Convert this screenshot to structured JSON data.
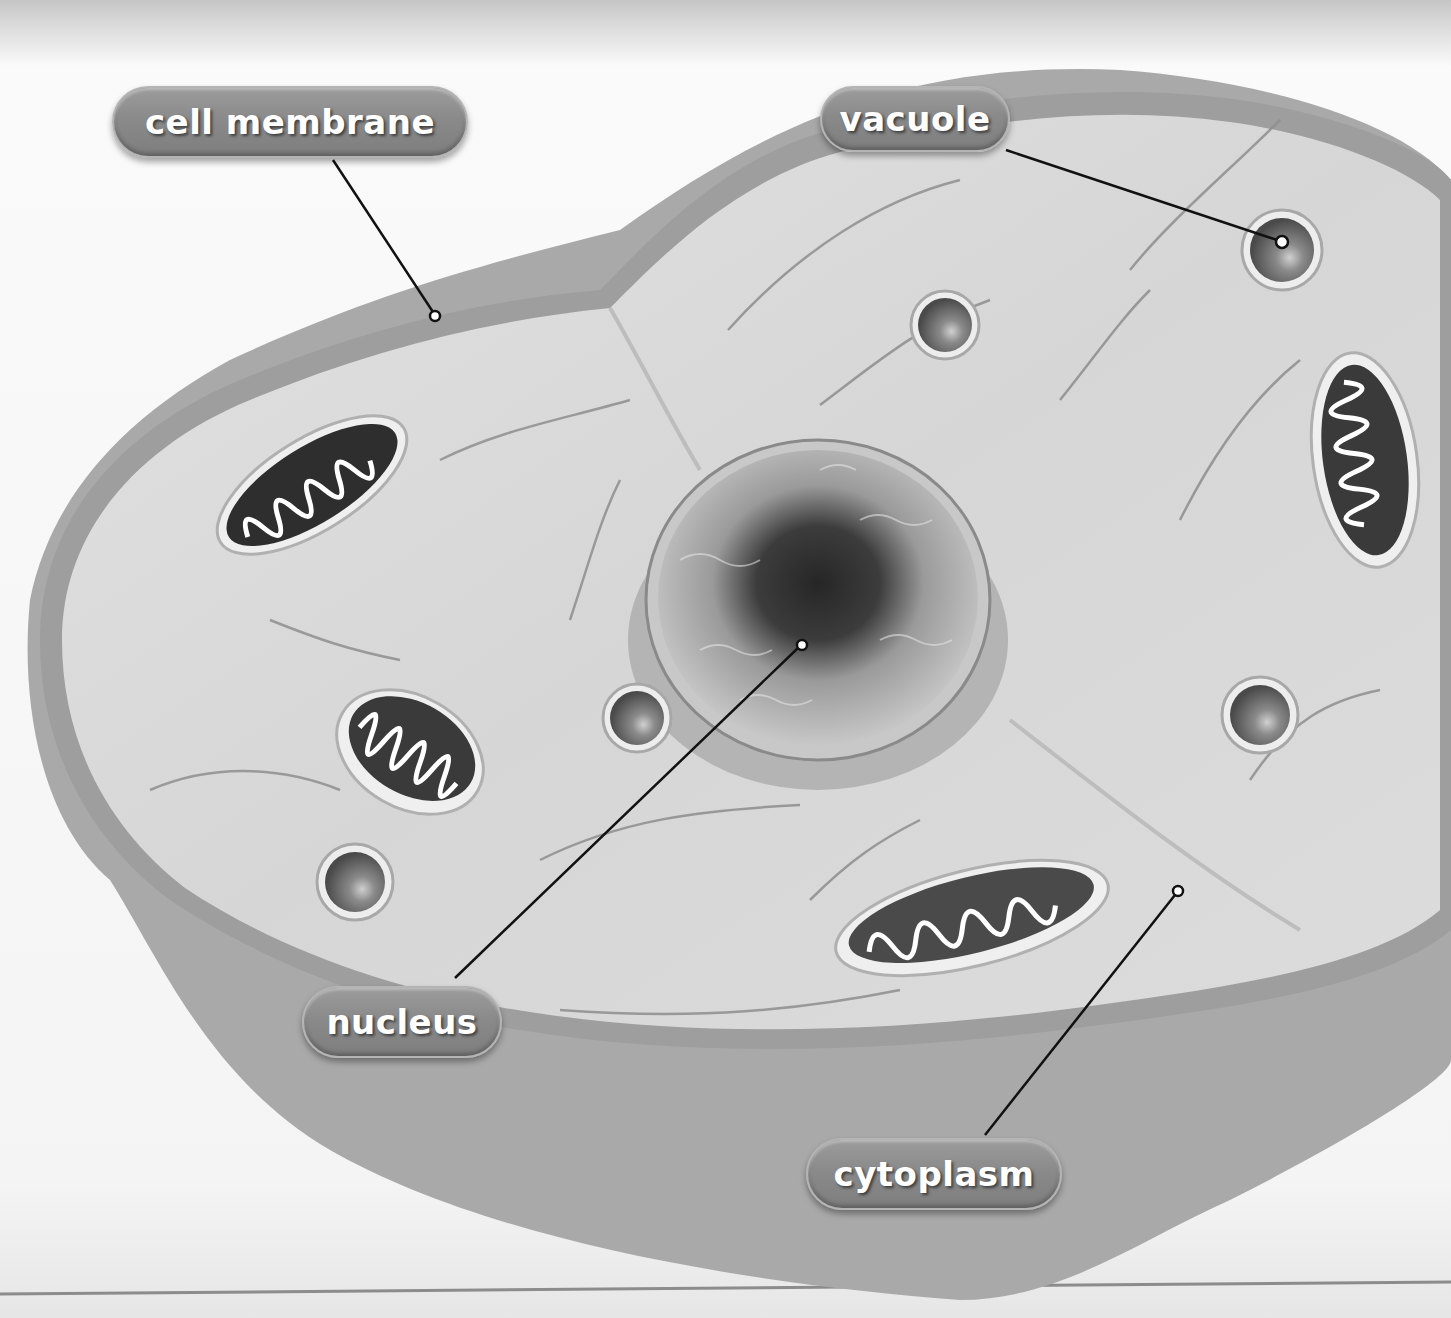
{
  "diagram": {
    "style": "grayscale 3D illustration",
    "labels": [
      {
        "id": "cell-membrane",
        "text": "cell membrane",
        "pointer": [
          435,
          316
        ]
      },
      {
        "id": "vacuole",
        "text": "vacuole",
        "pointer": [
          1282,
          242
        ]
      },
      {
        "id": "nucleus",
        "text": "nucleus",
        "pointer": [
          802,
          645
        ]
      },
      {
        "id": "cytoplasm",
        "text": "cytoplasm",
        "pointer": [
          1178,
          891
        ]
      }
    ],
    "organelles": {
      "mitochondria_count": 4,
      "vacuoles_count": 5,
      "nucleus_count": 1
    },
    "colors": {
      "background": "#f2f2f2",
      "cell_side": "#a8a8a8",
      "cytoplasm": "#d9d9d9",
      "membrane_rim": "#a0a0a0",
      "label_fill": "#8a8a8a",
      "label_text": "#ffffff",
      "leader_line": "#111111"
    }
  }
}
